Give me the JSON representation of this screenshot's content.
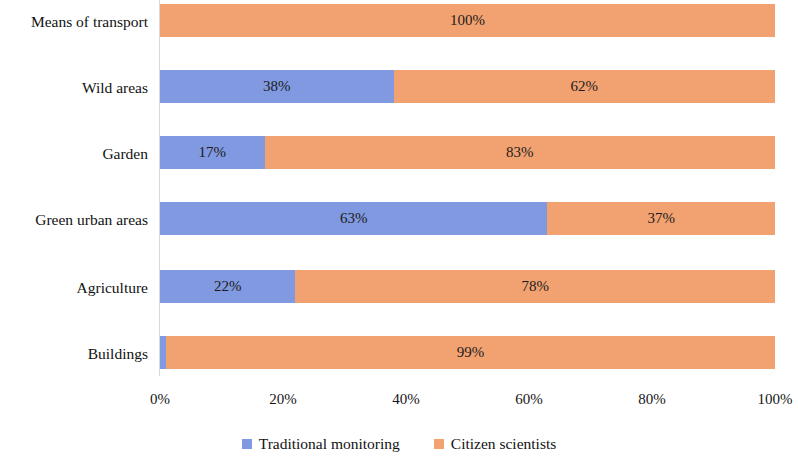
{
  "chart_data": {
    "type": "bar",
    "orientation": "horizontal",
    "stacked": true,
    "stack_mode": "percent",
    "title": "",
    "subtitle": "",
    "xlabel": "",
    "ylabel": "",
    "xlim": [
      0,
      100
    ],
    "xticks": [
      "0%",
      "20%",
      "40%",
      "60%",
      "80%",
      "100%"
    ],
    "xtick_values": [
      0,
      20,
      40,
      60,
      80,
      100
    ],
    "grid": false,
    "legend_position": "bottom",
    "categories": [
      "Means of transport",
      "Wild areas",
      "Garden",
      "Green urban areas",
      "Agriculture",
      "Buildings"
    ],
    "series": [
      {
        "name": "Traditional monitoring",
        "color": "#8099e0",
        "values": [
          0,
          38,
          17,
          63,
          22,
          1
        ],
        "labels": [
          "",
          "38%",
          "17%",
          "63%",
          "22%",
          ""
        ]
      },
      {
        "name": "Citizen scientists",
        "color": "#f2a271",
        "values": [
          100,
          62,
          83,
          37,
          78,
          99
        ],
        "labels": [
          "100%",
          "62%",
          "83%",
          "37%",
          "78%",
          "99%"
        ]
      }
    ]
  },
  "legend": {
    "items": [
      {
        "label": "Traditional monitoring",
        "color": "#8099e0"
      },
      {
        "label": "Citizen scientists",
        "color": "#f2a271"
      }
    ]
  }
}
